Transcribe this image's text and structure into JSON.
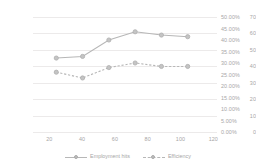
{
  "chart_data": {
    "type": "line",
    "title": "",
    "xlabel": "",
    "ylabel": "",
    "x": [
      20,
      40,
      60,
      80,
      100,
      120
    ],
    "categories": [
      "20",
      "40",
      "60",
      "80",
      "100",
      "120"
    ],
    "series": [
      {
        "name": "Employment hits",
        "axis": "left",
        "style": "solid",
        "marker": "circle",
        "color": "#b7b7b7",
        "values": [
          45,
          46,
          56,
          61,
          59,
          58
        ]
      },
      {
        "name": "Efficiency",
        "axis": "right",
        "style": "dashed",
        "marker": "circle",
        "color": "#b7b7b7",
        "values": [
          0.26,
          0.235,
          0.28,
          0.3,
          0.285,
          0.285
        ]
      }
    ],
    "ylim": [
      0,
      70
    ],
    "y2lim": [
      0,
      0.5
    ],
    "yticks": [
      "0",
      "10",
      "20",
      "30",
      "40",
      "50",
      "60",
      "70"
    ],
    "y2ticks": [
      "0.00%",
      "5.00%",
      "10.00%",
      "15.00%",
      "20.00%",
      "25.00%",
      "30.00%",
      "35.00%",
      "40.00%",
      "45.00%",
      "50.00%"
    ],
    "xticks": [
      "20",
      "40",
      "60",
      "80",
      "100",
      "120"
    ],
    "grid": true,
    "legend_position": "bottom",
    "legend": [
      "Employment hits",
      "Efficiency"
    ]
  },
  "axes": {
    "left_ticks": [
      "70",
      "60",
      "50",
      "40",
      "30",
      "20",
      "10",
      "0"
    ],
    "right_ticks": [
      "50.00%",
      "45.00%",
      "40.00%",
      "35.00%",
      "30.00%",
      "25.00%",
      "20.00%",
      "15.00%",
      "10.00%",
      "5.00%",
      "0.00%"
    ],
    "x_ticks": [
      "20",
      "40",
      "60",
      "80",
      "100",
      "120"
    ]
  },
  "legend": {
    "items": [
      {
        "label": "Employment hits"
      },
      {
        "label": "Efficiency"
      }
    ]
  },
  "colors": {
    "series": "#b7b7b7",
    "grid": "#eceaea",
    "text": "#a6a6a6"
  }
}
